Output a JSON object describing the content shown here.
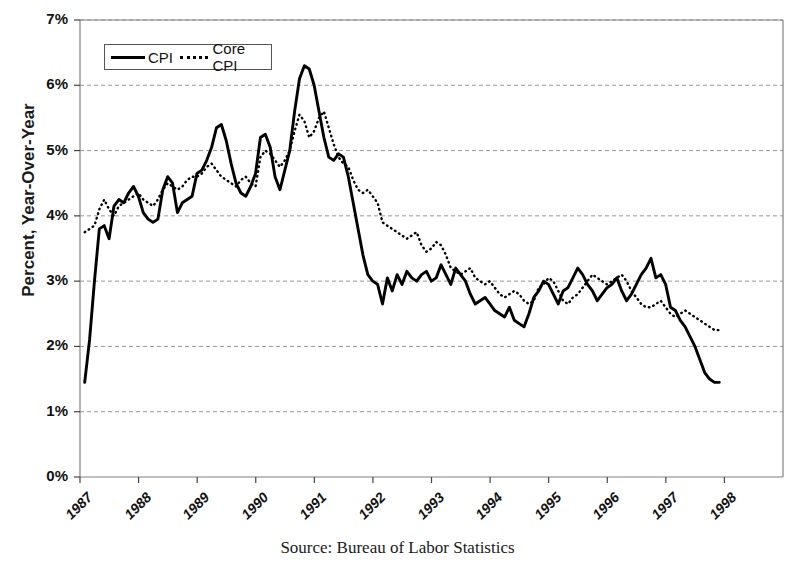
{
  "chart_data": {
    "type": "line",
    "title": "",
    "xlabel": "",
    "ylabel": "Percent, Year-Over-Year",
    "caption": "Source: Bureau of Labor Statistics",
    "grid": true,
    "legend_position": "top-left",
    "ylim": [
      0,
      7
    ],
    "ytick_labels": [
      "0%",
      "1%",
      "2%",
      "3%",
      "4%",
      "5%",
      "6%",
      "7%"
    ],
    "ytick_values": [
      0,
      1,
      2,
      3,
      4,
      5,
      6,
      7
    ],
    "xtick_labels": [
      "1987",
      "1988",
      "1989",
      "1990",
      "1991",
      "1992",
      "1993",
      "1994",
      "1995",
      "1996",
      "1997",
      "1998"
    ],
    "xtick_values": [
      1987,
      1988,
      1989,
      1990,
      1991,
      1992,
      1993,
      1994,
      1995,
      1996,
      1997,
      1998
    ],
    "xlim": [
      1987.0,
      1999.0
    ],
    "x_start": 1987.08,
    "x_step": 0.0833333,
    "series": [
      {
        "name": "CPI",
        "style": "solid",
        "color": "#000000",
        "values": [
          1.45,
          2.1,
          3.0,
          3.8,
          3.85,
          3.65,
          4.15,
          4.25,
          4.2,
          4.35,
          4.45,
          4.3,
          4.05,
          3.95,
          3.9,
          3.95,
          4.4,
          4.6,
          4.5,
          4.05,
          4.2,
          4.25,
          4.3,
          4.65,
          4.7,
          4.85,
          5.05,
          5.35,
          5.4,
          5.15,
          4.8,
          4.5,
          4.35,
          4.3,
          4.45,
          4.65,
          5.2,
          5.25,
          5.05,
          4.6,
          4.4,
          4.7,
          5.0,
          5.6,
          6.1,
          6.3,
          6.25,
          6.0,
          5.6,
          5.2,
          4.9,
          4.85,
          4.95,
          4.9,
          4.6,
          4.2,
          3.8,
          3.4,
          3.1,
          3.0,
          2.95,
          2.65,
          3.05,
          2.85,
          3.1,
          2.95,
          3.15,
          3.05,
          3.0,
          3.1,
          3.15,
          3.0,
          3.05,
          3.25,
          3.1,
          2.95,
          3.2,
          3.1,
          3.0,
          2.8,
          2.65,
          2.7,
          2.75,
          2.65,
          2.55,
          2.5,
          2.45,
          2.6,
          2.4,
          2.35,
          2.3,
          2.5,
          2.75,
          2.85,
          3.0,
          2.95,
          2.8,
          2.65,
          2.85,
          2.9,
          3.05,
          3.2,
          3.1,
          2.95,
          2.85,
          2.7,
          2.8,
          2.9,
          2.95,
          3.05,
          2.85,
          2.7,
          2.8,
          2.95,
          3.1,
          3.2,
          3.35,
          3.05,
          3.1,
          2.95,
          2.6,
          2.55,
          2.4,
          2.3,
          2.15,
          2.0,
          1.8,
          1.6,
          1.5,
          1.45,
          1.45
        ]
      },
      {
        "name": "Core CPI",
        "style": "dotted",
        "color": "#000000",
        "values": [
          3.75,
          3.8,
          3.85,
          4.1,
          4.25,
          4.1,
          4.0,
          4.15,
          4.2,
          4.25,
          4.3,
          4.35,
          4.25,
          4.2,
          4.15,
          4.25,
          4.4,
          4.5,
          4.45,
          4.4,
          4.45,
          4.55,
          4.6,
          4.6,
          4.65,
          4.75,
          4.8,
          4.7,
          4.6,
          4.55,
          4.5,
          4.45,
          4.55,
          4.6,
          4.5,
          4.45,
          4.9,
          5.0,
          4.95,
          4.85,
          4.75,
          4.85,
          5.0,
          5.3,
          5.55,
          5.45,
          5.2,
          5.3,
          5.5,
          5.6,
          5.35,
          5.1,
          4.9,
          4.8,
          4.75,
          4.55,
          4.4,
          4.35,
          4.4,
          4.3,
          4.2,
          3.9,
          3.85,
          3.8,
          3.75,
          3.7,
          3.65,
          3.7,
          3.75,
          3.55,
          3.45,
          3.5,
          3.6,
          3.55,
          3.4,
          3.2,
          3.15,
          3.1,
          3.15,
          3.2,
          3.05,
          3.0,
          2.95,
          3.0,
          2.9,
          2.8,
          2.75,
          2.8,
          2.85,
          2.8,
          2.7,
          2.65,
          2.7,
          2.9,
          2.95,
          3.05,
          3.0,
          2.85,
          2.7,
          2.65,
          2.75,
          2.8,
          2.9,
          3.0,
          3.1,
          3.05,
          3.0,
          2.95,
          3.0,
          3.05,
          3.1,
          3.0,
          2.85,
          2.75,
          2.65,
          2.6,
          2.6,
          2.65,
          2.7,
          2.6,
          2.5,
          2.45,
          2.5,
          2.55,
          2.5,
          2.45,
          2.4,
          2.35,
          2.3,
          2.25,
          2.25
        ]
      }
    ]
  },
  "legend": {
    "items": [
      {
        "label": "CPI",
        "style": "solid"
      },
      {
        "label": "Core CPI",
        "style": "dotted"
      }
    ]
  },
  "axes": {
    "ylabel": "Percent, Year-Over-Year"
  },
  "caption": {
    "text": "Source: Bureau of Labor Statistics"
  },
  "colors": {
    "line": "#000000",
    "grid": "#999999",
    "frame": "#808080",
    "text": "#111111"
  }
}
